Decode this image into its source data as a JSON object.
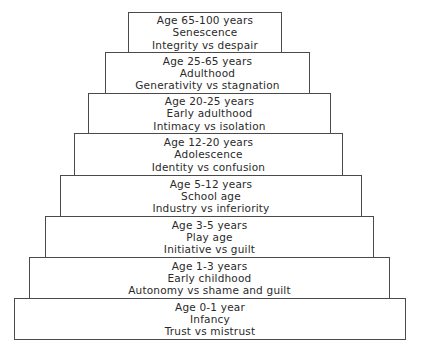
{
  "diagram": {
    "type": "stepped-pyramid",
    "tiers": [
      {
        "age": "Age 65-100 years",
        "stage": "Senescence",
        "conflict": "Integrity vs despair",
        "box": [
          128,
          12,
          282,
          53
        ]
      },
      {
        "age": "Age 25-65 years",
        "stage": "Adulthood",
        "conflict": "Generativity vs stagnation",
        "box": [
          105,
          52,
          310,
          94
        ]
      },
      {
        "age": "Age 20-25 years",
        "stage": "Early adulthood",
        "conflict": "Intimacy vs isolation",
        "box": [
          88,
          93,
          331,
          134
        ]
      },
      {
        "age": "Age 12-20 years",
        "stage": "Adolescence",
        "conflict": "Identity vs confusion",
        "box": [
          74,
          133,
          343,
          176
        ]
      },
      {
        "age": "Age 5-12 years",
        "stage": "School age",
        "conflict": "Industry vs inferiority",
        "box": [
          60,
          175,
          362,
          217
        ]
      },
      {
        "age": "Age 3-5 years",
        "stage": "Play age",
        "conflict": "Initiative vs guilt",
        "box": [
          45,
          216,
          374,
          258
        ]
      },
      {
        "age": "Age 1-3 years",
        "stage": "Early childhood",
        "conflict": "Autonomy vs shame and guilt",
        "box": [
          29,
          257,
          390,
          299
        ]
      },
      {
        "age": "Age 0-1 year",
        "stage": "Infancy",
        "conflict": "Trust vs mistrust",
        "box": [
          14,
          298,
          406,
          340
        ]
      }
    ]
  }
}
